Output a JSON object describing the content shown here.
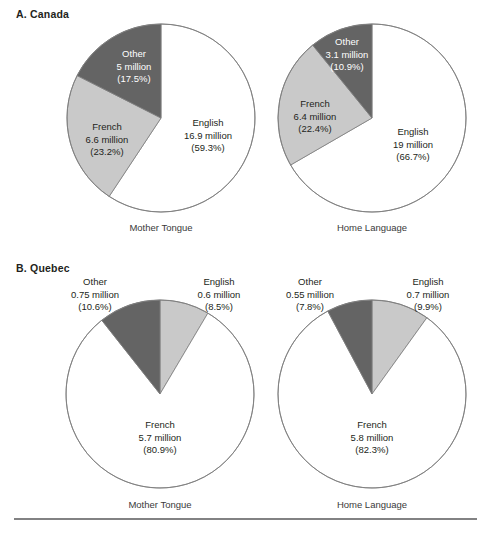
{
  "figure": {
    "width": 489,
    "height": 533,
    "background": "#ffffff"
  },
  "colors": {
    "english_canada": "#ffffff",
    "french_canada": "#c9c9c9",
    "other_canada": "#646464",
    "stroke": "#7d7d7d",
    "text": "#231f20",
    "caption": "#3a3a3a",
    "rule": "#58585a"
  },
  "panels": [
    {
      "id": "canada",
      "title": "A. Canada",
      "title_x": 16,
      "title_y": 18,
      "charts": [
        {
          "id": "canada-mother-tongue",
          "caption": "Mother Tongue",
          "cx": 161,
          "cy": 118,
          "r": 94,
          "caption_x": 161,
          "caption_y": 231
        },
        {
          "id": "canada-home-language",
          "caption": "Home Language",
          "cx": 372,
          "cy": 118,
          "r": 94,
          "caption_x": 372,
          "caption_y": 231
        }
      ]
    },
    {
      "id": "quebec",
      "title": "B. Quebec",
      "title_x": 16,
      "title_y": 272,
      "charts": [
        {
          "id": "quebec-mother-tongue",
          "caption": "Mother Tongue",
          "cx": 160,
          "cy": 394,
          "r": 94,
          "caption_x": 160,
          "caption_y": 508
        },
        {
          "id": "quebec-home-language",
          "caption": "Home Language",
          "cx": 372,
          "cy": 394,
          "r": 94,
          "caption_x": 372,
          "caption_y": 508
        }
      ]
    }
  ],
  "rule": {
    "x1": 14,
    "x2": 477,
    "y": 519
  },
  "chart_data": [
    {
      "type": "pie",
      "id": "canada-mother-tongue",
      "title": "A. Canada",
      "subtitle": "Mother Tongue",
      "start_angle_deg": 0,
      "direction": "clockwise",
      "categories": [
        "English",
        "French",
        "Other"
      ],
      "values": [
        16.9,
        6.6,
        5.0
      ],
      "units": "million",
      "percents": [
        59.3,
        23.2,
        17.5
      ],
      "colors": [
        "#ffffff",
        "#c9c9c9",
        "#646464"
      ],
      "labels": [
        {
          "name": "English",
          "lines": [
            "English",
            "16.9 million",
            "(59.3%)"
          ],
          "x": 208,
          "y": 126,
          "anchor": "middle",
          "style": "light-bg",
          "placement": "inside"
        },
        {
          "name": "French",
          "lines": [
            "French",
            "6.6 million",
            "(23.2%)"
          ],
          "x": 107,
          "y": 130,
          "anchor": "middle",
          "style": "light-bg",
          "placement": "inside"
        },
        {
          "name": "Other",
          "lines": [
            "Other",
            "5 million",
            "(17.5%)"
          ],
          "x": 134,
          "y": 57,
          "anchor": "middle",
          "style": "dark-bg",
          "placement": "inside"
        }
      ]
    },
    {
      "type": "pie",
      "id": "canada-home-language",
      "title": "A. Canada",
      "subtitle": "Home Language",
      "start_angle_deg": 0,
      "direction": "clockwise",
      "categories": [
        "English",
        "French",
        "Other"
      ],
      "values": [
        19.0,
        6.4,
        3.1
      ],
      "units": "million",
      "percents": [
        66.7,
        22.4,
        10.9
      ],
      "colors": [
        "#ffffff",
        "#c9c9c9",
        "#646464"
      ],
      "labels": [
        {
          "name": "English",
          "lines": [
            "English",
            "19 million",
            "(66.7%)"
          ],
          "x": 413,
          "y": 135,
          "anchor": "middle",
          "style": "light-bg",
          "placement": "inside"
        },
        {
          "name": "French",
          "lines": [
            "French",
            "6.4 million",
            "(22.4%)"
          ],
          "x": 315,
          "y": 107,
          "anchor": "middle",
          "style": "light-bg",
          "placement": "inside"
        },
        {
          "name": "Other",
          "lines": [
            "Other",
            "3.1 million",
            "(10.9%)"
          ],
          "x": 347,
          "y": 45,
          "anchor": "middle",
          "style": "dark-bg",
          "placement": "inside"
        }
      ]
    },
    {
      "type": "pie",
      "id": "quebec-mother-tongue",
      "title": "B. Quebec",
      "subtitle": "Mother Tongue",
      "start_angle_deg": 0,
      "direction": "clockwise",
      "categories": [
        "English",
        "French",
        "Other"
      ],
      "values": [
        0.6,
        5.7,
        0.75
      ],
      "units": "million",
      "percents": [
        8.5,
        80.9,
        10.6
      ],
      "colors": [
        "#c9c9c9",
        "#ffffff",
        "#646464"
      ],
      "labels": [
        {
          "name": "English",
          "lines": [
            "English",
            "0.6 million",
            "(8.5%)"
          ],
          "x": 219,
          "y": 285,
          "anchor": "middle",
          "style": "outside",
          "placement": "outside"
        },
        {
          "name": "French",
          "lines": [
            "French",
            "5.7 million",
            "(80.9%)"
          ],
          "x": 160,
          "y": 428,
          "anchor": "middle",
          "style": "light-bg",
          "placement": "inside"
        },
        {
          "name": "Other",
          "lines": [
            "Other",
            "0.75 million",
            "(10.6%)"
          ],
          "x": 95,
          "y": 285,
          "anchor": "middle",
          "style": "outside",
          "placement": "outside"
        }
      ]
    },
    {
      "type": "pie",
      "id": "quebec-home-language",
      "title": "B. Quebec",
      "subtitle": "Home Language",
      "start_angle_deg": 0,
      "direction": "clockwise",
      "categories": [
        "English",
        "French",
        "Other"
      ],
      "values": [
        0.7,
        5.8,
        0.55
      ],
      "units": "million",
      "percents": [
        9.9,
        82.3,
        7.8
      ],
      "colors": [
        "#c9c9c9",
        "#ffffff",
        "#646464"
      ],
      "labels": [
        {
          "name": "English",
          "lines": [
            "English",
            "0.7 million",
            "(9.9%)"
          ],
          "x": 428,
          "y": 285,
          "anchor": "middle",
          "style": "outside",
          "placement": "outside"
        },
        {
          "name": "French",
          "lines": [
            "French",
            "5.8 million",
            "(82.3%)"
          ],
          "x": 372,
          "y": 428,
          "anchor": "middle",
          "style": "light-bg",
          "placement": "inside"
        },
        {
          "name": "Other",
          "lines": [
            "Other",
            "0.55 million",
            "(7.8%)"
          ],
          "x": 310,
          "y": 285,
          "anchor": "middle",
          "style": "outside",
          "placement": "outside"
        }
      ]
    }
  ]
}
